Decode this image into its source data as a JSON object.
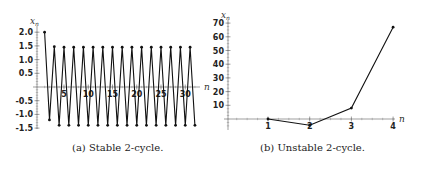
{
  "chart_data": [
    {
      "type": "line",
      "title": "",
      "caption": "(a) Stable 2-cycle.",
      "xlabel": "n",
      "ylabel": "x_n",
      "xticks": [
        5,
        10,
        15,
        20,
        25,
        30
      ],
      "yticks": [
        2.0,
        1.5,
        1.0,
        0.5,
        -0.5,
        -1.0,
        -1.5
      ],
      "ytick_labels": [
        "2.0",
        "1.5",
        "1.0",
        "0.5",
        "-0.5",
        "-1.0",
        "-1.5"
      ],
      "xlim": [
        0,
        33
      ],
      "ylim": [
        -1.55,
        2.1
      ],
      "grid": false,
      "markers": true,
      "x": [
        1,
        2,
        3,
        4,
        5,
        6,
        7,
        8,
        9,
        10,
        11,
        12,
        13,
        14,
        15,
        16,
        17,
        18,
        19,
        20,
        21,
        22,
        23,
        24,
        25,
        26,
        27,
        28,
        29,
        30,
        31,
        32
      ],
      "values": [
        2.0,
        -1.2,
        1.47,
        -1.4,
        1.45,
        -1.4,
        1.45,
        -1.4,
        1.45,
        -1.4,
        1.45,
        -1.4,
        1.45,
        -1.4,
        1.45,
        -1.4,
        1.45,
        -1.4,
        1.45,
        -1.4,
        1.45,
        -1.4,
        1.45,
        -1.4,
        1.45,
        -1.4,
        1.45,
        -1.4,
        1.45,
        -1.4,
        1.45,
        -1.4
      ]
    },
    {
      "type": "line",
      "title": "",
      "caption": "(b) Unstable 2-cycle.",
      "xlabel": "n",
      "ylabel": "x_n",
      "xticks": [
        1,
        2,
        3,
        4
      ],
      "yticks": [
        10,
        20,
        30,
        40,
        50,
        60,
        70
      ],
      "ytick_labels": [
        "10",
        "20",
        "30",
        "40",
        "50",
        "60",
        "70"
      ],
      "xlim": [
        0,
        4.3
      ],
      "ylim": [
        -8,
        72
      ],
      "grid": false,
      "markers": true,
      "x": [
        1,
        2,
        3,
        4
      ],
      "values": [
        0,
        -4.5,
        8,
        67
      ]
    }
  ]
}
